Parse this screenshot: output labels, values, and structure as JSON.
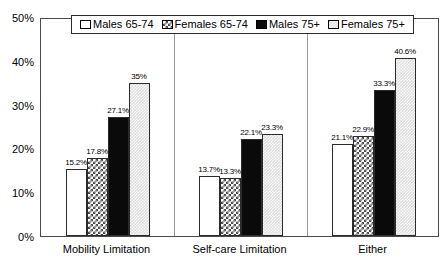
{
  "chart_data": {
    "type": "bar",
    "title": "",
    "subtitle": "",
    "xlabel": "",
    "ylabel": "",
    "ylim": [
      0,
      50
    ],
    "ytick_labels": [
      "50%",
      "40%",
      "30%",
      "20%",
      "10%",
      "0%"
    ],
    "ytick_values": [
      50,
      40,
      30,
      20,
      10,
      0
    ],
    "grid": false,
    "legend_position": "top-center",
    "categories": [
      "Mobility Limitation",
      "Self-care Limitation",
      "Either"
    ],
    "series": [
      {
        "name": "Males 65-74",
        "swatch": "solid-white",
        "values": [
          15.2,
          13.7,
          21.1
        ],
        "labels": [
          "15.2%",
          "13.7%",
          "21.1%"
        ]
      },
      {
        "name": "Females 65-74",
        "swatch": "cross-hatch",
        "values": [
          17.8,
          13.3,
          22.9
        ],
        "labels": [
          "17.8%",
          "13.3%",
          "22.9%"
        ]
      },
      {
        "name": "Males 75+",
        "swatch": "solid-black",
        "values": [
          27.1,
          22.1,
          33.3
        ],
        "labels": [
          "27.1%",
          "22.1%",
          "33.3%"
        ]
      },
      {
        "name": "Females 75+",
        "swatch": "light-dots",
        "values": [
          35.0,
          23.3,
          40.6
        ],
        "labels": [
          "35%",
          "23.3%",
          "40.6%"
        ]
      }
    ]
  },
  "colors": {
    "bar_outline": "#2b2b2b",
    "frame": "#4a4a4a",
    "males_65_74": "#ffffff",
    "females_65_74": "#4a4a4a",
    "males_75": "#0b0a0a",
    "females_75": "#dedede",
    "text": "#000000",
    "background": "#ffffff"
  }
}
